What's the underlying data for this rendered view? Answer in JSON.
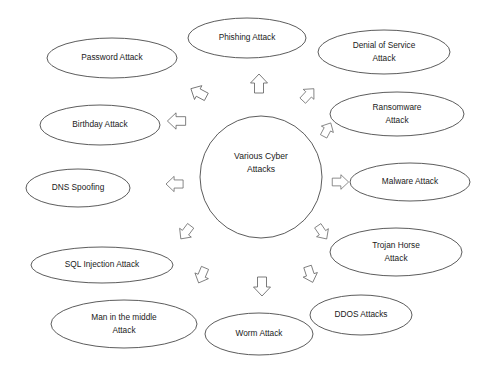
{
  "diagram": {
    "type": "radial-hub-and-spoke",
    "hub": {
      "id": "various-cyber-attacks",
      "label_line1": "Various Cyber",
      "label_line2": "Attacks",
      "cx": 261,
      "cy": 177,
      "r": 61
    },
    "stroke_color": "#4a4a4a",
    "background_color": "#ffffff",
    "text_color": "#1a1a1a",
    "nodes": [
      {
        "id": "phishing-attack",
        "label_line1": "Phishing Attack",
        "label_line2": "",
        "cx": 247,
        "cy": 38,
        "rx": 59,
        "ry": 20
      },
      {
        "id": "denial-of-service-attack",
        "label_line1": "Denial of Service",
        "label_line2": "Attack",
        "cx": 384,
        "cy": 52,
        "rx": 66,
        "ry": 22
      },
      {
        "id": "ransomware-attack",
        "label_line1": "Ransomware",
        "label_line2": "Attack",
        "cx": 397,
        "cy": 114,
        "rx": 67,
        "ry": 22
      },
      {
        "id": "malware-attack",
        "label_line1": "Malware Attack",
        "label_line2": "",
        "cx": 410,
        "cy": 182,
        "rx": 60,
        "ry": 19
      },
      {
        "id": "trojan-horse-attack",
        "label_line1": "Trojan Horse",
        "label_line2": "Attack",
        "cx": 396,
        "cy": 252,
        "rx": 66,
        "ry": 24
      },
      {
        "id": "ddos-attacks",
        "label_line1": "DDOS Attacks",
        "label_line2": "",
        "cx": 361,
        "cy": 315,
        "rx": 51,
        "ry": 20
      },
      {
        "id": "worm-attack",
        "label_line1": "Worm Attack",
        "label_line2": "",
        "cx": 259,
        "cy": 334,
        "rx": 54,
        "ry": 21
      },
      {
        "id": "man-in-the-middle-attack",
        "label_line1": "Man in the middle",
        "label_line2": "Attack",
        "cx": 124,
        "cy": 324,
        "rx": 73,
        "ry": 24
      },
      {
        "id": "sql-injection-attack",
        "label_line1": "SQL Injection Attack",
        "label_line2": "",
        "cx": 102,
        "cy": 265,
        "rx": 71,
        "ry": 18
      },
      {
        "id": "dns-spoofing",
        "label_line1": "DNS Spoofing",
        "label_line2": "",
        "cx": 78,
        "cy": 188,
        "rx": 52,
        "ry": 19
      },
      {
        "id": "birthday-attack",
        "label_line1": "Birthday Attack",
        "label_line2": "",
        "cx": 100,
        "cy": 125,
        "rx": 60,
        "ry": 20
      },
      {
        "id": "password-attack",
        "label_line1": "Password Attack",
        "label_line2": "",
        "cx": 112,
        "cy": 58,
        "rx": 65,
        "ry": 20
      }
    ],
    "arrows": [
      {
        "id": "arrow-to-phishing",
        "cx": 259,
        "cy": 84,
        "angle": -90,
        "scale": 1.0
      },
      {
        "id": "arrow-to-denial-of-service",
        "cx": 308,
        "cy": 95,
        "angle": -47,
        "scale": 0.86
      },
      {
        "id": "arrow-to-ransomware",
        "cx": 327,
        "cy": 130,
        "angle": -62,
        "scale": 0.8
      },
      {
        "id": "arrow-to-malware",
        "cx": 340,
        "cy": 182,
        "angle": 0,
        "scale": 0.86
      },
      {
        "id": "arrow-to-trojan-horse",
        "cx": 322,
        "cy": 232,
        "angle": 56,
        "scale": 0.84
      },
      {
        "id": "arrow-to-ddos",
        "cx": 310,
        "cy": 274,
        "angle": 72,
        "scale": 0.88
      },
      {
        "id": "arrow-to-worm",
        "cx": 262,
        "cy": 286,
        "angle": 90,
        "scale": 1.0
      },
      {
        "id": "arrow-to-man-in-the-middle",
        "cx": 202,
        "cy": 275,
        "angle": 113,
        "scale": 0.86
      },
      {
        "id": "arrow-to-sql-injection",
        "cx": 186,
        "cy": 232,
        "angle": 127,
        "scale": 0.86
      },
      {
        "id": "arrow-to-dns-spoofing",
        "cx": 175,
        "cy": 184,
        "angle": 180,
        "scale": 0.9
      },
      {
        "id": "arrow-to-birthday",
        "cx": 177,
        "cy": 121,
        "angle": 180,
        "scale": 0.96
      },
      {
        "id": "arrow-to-password",
        "cx": 199,
        "cy": 93,
        "angle": 208,
        "scale": 0.92
      }
    ]
  }
}
